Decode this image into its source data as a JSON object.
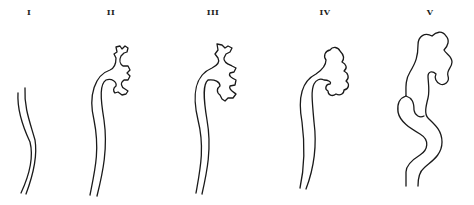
{
  "figure": {
    "stages": [
      {
        "label": "I",
        "x": 29
      },
      {
        "label": "II",
        "x": 111
      },
      {
        "label": "III",
        "x": 213
      },
      {
        "label": "IV",
        "x": 325
      },
      {
        "label": "V",
        "x": 430
      }
    ]
  }
}
